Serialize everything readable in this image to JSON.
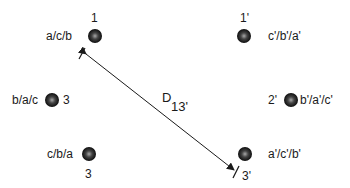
{
  "diagram": {
    "type": "conductor-arrangement",
    "colors": {
      "ink": "#1a1a1a",
      "dot_dark": "#111111",
      "dot_light": "#9a9a9a",
      "background": "#ffffff"
    },
    "left_circuit": [
      {
        "id": "1",
        "number": "1",
        "phases": "a/c/b"
      },
      {
        "id": "2",
        "number": "2",
        "phases": "b/a/c"
      },
      {
        "id": "3",
        "number": "3",
        "phases": "c/b/a"
      }
    ],
    "right_circuit": [
      {
        "id": "1p",
        "number": "1'",
        "phases": "c'/b'/a'"
      },
      {
        "id": "2p",
        "number": "2'",
        "phases": "b'/a'/c'"
      },
      {
        "id": "3p",
        "number": "3'",
        "phases": "a'/c'/b'"
      }
    ],
    "dimension": {
      "from": "1",
      "to": "3'",
      "label": "D",
      "subscript": "13'"
    }
  }
}
